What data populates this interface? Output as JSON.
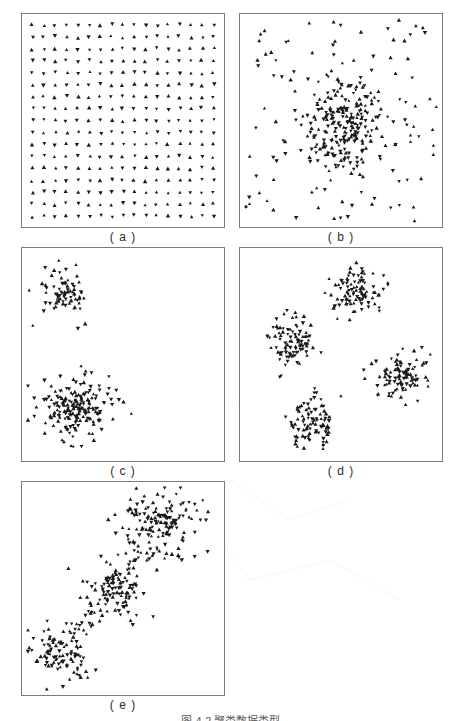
{
  "figure": {
    "caption": "图 4-2  聚类数据类型",
    "background_color": "#ffffff",
    "marker_color": "#1a1a1a",
    "panel_border_color": "#7a7a7a",
    "marker_shape": "triangle"
  },
  "panels": [
    {
      "id": "a",
      "label": "( a )",
      "description": "uniform regular grid of points"
    },
    {
      "id": "b",
      "label": "( b )",
      "description": "single dense central cluster with uniform background noise"
    },
    {
      "id": "c",
      "label": "( c )",
      "description": "two well separated clusters"
    },
    {
      "id": "d",
      "label": "( d )",
      "description": "four well separated clusters"
    },
    {
      "id": "e",
      "label": "( e )",
      "description": "elongated chain of three linked clusters"
    }
  ],
  "chart_data": [
    {
      "id": "a",
      "type": "scatter",
      "title": "( a )",
      "xlabel": "",
      "ylabel": "",
      "xlim": [
        0,
        1
      ],
      "ylim": [
        0,
        1
      ],
      "grid": false,
      "legend": "none",
      "series": [
        {
          "name": "grid",
          "marker": "triangle",
          "color": "#1a1a1a",
          "generator": "regular-grid",
          "rows": 17,
          "cols": 17,
          "jitter": 0.006,
          "n": 289
        }
      ]
    },
    {
      "id": "b",
      "type": "scatter",
      "title": "( b )",
      "xlabel": "",
      "ylabel": "",
      "xlim": [
        0,
        1
      ],
      "ylim": [
        0,
        1
      ],
      "grid": false,
      "legend": "none",
      "series": [
        {
          "name": "core-cluster",
          "marker": "triangle",
          "color": "#1a1a1a",
          "generator": "gaussian",
          "cx": 0.52,
          "cy": 0.52,
          "sx": 0.105,
          "sy": 0.115,
          "n": 190
        },
        {
          "name": "background-noise",
          "marker": "triangle",
          "color": "#1a1a1a",
          "generator": "uniform",
          "n": 135
        }
      ]
    },
    {
      "id": "c",
      "type": "scatter",
      "title": "( c )",
      "xlabel": "",
      "ylabel": "",
      "xlim": [
        0,
        1
      ],
      "ylim": [
        0,
        1
      ],
      "grid": false,
      "legend": "none",
      "series": [
        {
          "name": "cluster-top-left",
          "marker": "triangle",
          "color": "#1a1a1a",
          "generator": "gaussian",
          "cx": 0.2,
          "cy": 0.2,
          "sx": 0.065,
          "sy": 0.06,
          "n": 80
        },
        {
          "name": "cluster-bottom-left",
          "marker": "triangle",
          "color": "#1a1a1a",
          "generator": "gaussian",
          "cx": 0.26,
          "cy": 0.76,
          "sx": 0.09,
          "sy": 0.075,
          "n": 185
        }
      ]
    },
    {
      "id": "d",
      "type": "scatter",
      "title": "( d )",
      "xlabel": "",
      "ylabel": "",
      "xlim": [
        0,
        1
      ],
      "ylim": [
        0,
        1
      ],
      "grid": false,
      "legend": "none",
      "series": [
        {
          "name": "cluster-top",
          "marker": "triangle",
          "color": "#1a1a1a",
          "generator": "gaussian",
          "cx": 0.57,
          "cy": 0.19,
          "sx": 0.07,
          "sy": 0.06,
          "n": 95
        },
        {
          "name": "cluster-left",
          "marker": "triangle",
          "color": "#1a1a1a",
          "generator": "gaussian",
          "cx": 0.25,
          "cy": 0.44,
          "sx": 0.07,
          "sy": 0.065,
          "n": 95
        },
        {
          "name": "cluster-right",
          "marker": "triangle",
          "color": "#1a1a1a",
          "generator": "gaussian",
          "cx": 0.8,
          "cy": 0.6,
          "sx": 0.068,
          "sy": 0.062,
          "n": 95
        },
        {
          "name": "cluster-bottom",
          "marker": "triangle",
          "color": "#1a1a1a",
          "generator": "gaussian",
          "cx": 0.35,
          "cy": 0.84,
          "sx": 0.065,
          "sy": 0.06,
          "n": 95
        }
      ]
    },
    {
      "id": "e",
      "type": "scatter",
      "title": "( e )",
      "xlabel": "",
      "ylabel": "",
      "xlim": [
        0,
        1
      ],
      "ylim": [
        0,
        1
      ],
      "grid": false,
      "legend": "none",
      "series": [
        {
          "name": "chain-upper-right",
          "marker": "triangle",
          "color": "#1a1a1a",
          "generator": "gaussian",
          "cx": 0.68,
          "cy": 0.19,
          "sx": 0.105,
          "sy": 0.095,
          "n": 150
        },
        {
          "name": "chain-middle",
          "marker": "triangle",
          "color": "#1a1a1a",
          "generator": "gaussian",
          "cx": 0.47,
          "cy": 0.51,
          "sx": 0.09,
          "sy": 0.075,
          "n": 95
        },
        {
          "name": "chain-lower-left",
          "marker": "triangle",
          "color": "#1a1a1a",
          "generator": "gaussian",
          "cx": 0.17,
          "cy": 0.82,
          "sx": 0.075,
          "sy": 0.07,
          "n": 100
        },
        {
          "name": "bridge-upper",
          "marker": "triangle",
          "color": "#1a1a1a",
          "generator": "segment",
          "x1": 0.58,
          "y1": 0.33,
          "x2": 0.45,
          "y2": 0.47,
          "spread": 0.035,
          "n": 18
        },
        {
          "name": "bridge-lower",
          "marker": "triangle",
          "color": "#1a1a1a",
          "generator": "segment",
          "x1": 0.37,
          "y1": 0.62,
          "x2": 0.24,
          "y2": 0.74,
          "spread": 0.035,
          "n": 16
        }
      ]
    }
  ]
}
